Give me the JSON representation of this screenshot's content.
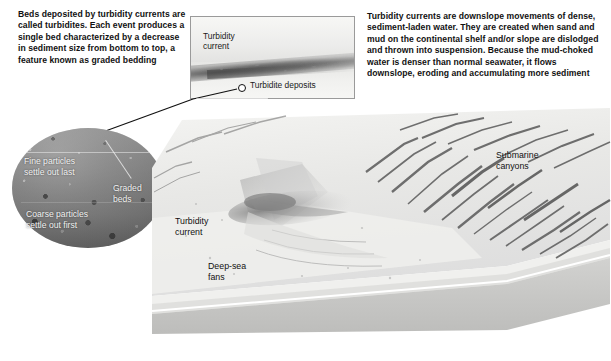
{
  "figure": {
    "domain_kind": "geology-textbook-diagram",
    "background_color": "#ffffff"
  },
  "captions": {
    "left": "Beds deposited by turbidity currents are called turbidites. Each event produces a single bed characterized by a decrease in sediment size from bottom to top, a feature known as graded bedding",
    "right": "Turbidity currents are downslope movements of dense, sediment-laden water. They are created when sand and mud on the continental shelf and/or slope are dislodged and thrown into suspension. Because the mud-choked water is denser than normal seawater, it flows downslope, eroding and accumulating more sediment"
  },
  "inset_photo": {
    "label_current": "Turbidity\ncurrent",
    "label_deposits": "Turbidite deposits",
    "border_color": "#9a9a9a"
  },
  "circle_inset": {
    "label_fine": "Fine particles\nsettle out last",
    "label_graded": "Graded\nbeds",
    "label_coarse": "Coarse particles\nsettle out first",
    "text_color": "#f2f2f2"
  },
  "block_diagram": {
    "label_turbidity_current": "Turbidity\ncurrent",
    "label_deep_sea_fans": "Deep-sea\nfans",
    "label_submarine_canyons": "Submarine\ncanyons",
    "label_color": "#111111",
    "terrain_tone": "#d6d6d4",
    "strata_tone": "#c9c9c7"
  }
}
